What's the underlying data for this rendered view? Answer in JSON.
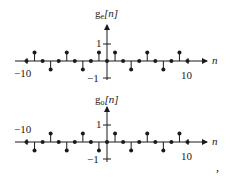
{
  "chart_data": [
    {
      "type": "stem",
      "title": "g_e[n]",
      "ylabel": "g_e[n]",
      "xlabel": "n",
      "x_tick_labels": [
        "-10",
        "10"
      ],
      "y_tick_labels": [
        "1",
        "-1"
      ],
      "xlim": [
        -10,
        10
      ],
      "ylim": [
        -1,
        1
      ],
      "x": [
        -10,
        -9,
        -8,
        -7,
        -6,
        -5,
        -4,
        -3,
        -2,
        -1,
        0,
        1,
        2,
        3,
        4,
        5,
        6,
        7,
        8,
        9,
        10
      ],
      "values": [
        0,
        0.5,
        0,
        -0.5,
        0,
        0.5,
        0,
        -0.5,
        0,
        0.5,
        0,
        0.5,
        0,
        -0.5,
        0,
        0.5,
        0,
        -0.5,
        0,
        0.5,
        0
      ]
    },
    {
      "type": "stem",
      "title": "g_o[n]",
      "ylabel": "g_o[n]",
      "xlabel": "n",
      "x_tick_labels": [
        "-10",
        "10"
      ],
      "y_tick_labels": [
        "1",
        "-1"
      ],
      "xlim": [
        -10,
        10
      ],
      "ylim": [
        -1,
        1
      ],
      "x": [
        -10,
        -9,
        -8,
        -7,
        -6,
        -5,
        -4,
        -3,
        -2,
        -1,
        0,
        1,
        2,
        3,
        4,
        5,
        6,
        7,
        8,
        9,
        10
      ],
      "values": [
        0,
        -0.5,
        0,
        0.5,
        0,
        -0.5,
        0,
        0.5,
        0,
        -0.5,
        0,
        0.5,
        0,
        -0.5,
        0,
        0.5,
        0,
        -0.5,
        0,
        0.5,
        0
      ]
    }
  ],
  "plots": [
    {
      "ylabel_main": "g",
      "ylabel_sub": "e",
      "ylabel_arg": "[n]",
      "xlabel": "n",
      "tick_neg10": "−10",
      "tick_pos10": "10",
      "tick_pos1": "1",
      "tick_neg1": "−1"
    },
    {
      "ylabel_main": "g",
      "ylabel_sub": "o",
      "ylabel_arg": "[n]",
      "xlabel": "n",
      "tick_neg10": "−10",
      "tick_pos10": "10",
      "tick_pos1": "1",
      "tick_neg1": "−1"
    }
  ],
  "trailing_punctuation": ","
}
